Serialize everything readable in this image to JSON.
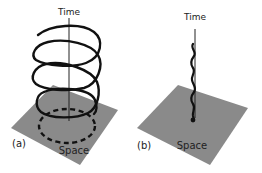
{
  "figure": {
    "panels": [
      {
        "id": "a",
        "label": "(a)",
        "axis_label": "Time",
        "plane_label": "Space",
        "curve": "helix",
        "description": "Helical worldline spiraling around the time axis above a spatial plane; bottom loop dashed below the plane"
      },
      {
        "id": "b",
        "label": "(b)",
        "axis_label": "Time",
        "plane_label": "Space",
        "curve": "wiggle",
        "description": "Tight wiggling worldline along the time axis, ending at a point on the spatial plane"
      }
    ],
    "colors": {
      "plane": "#8a8a8a",
      "line": "#111111",
      "axis": "#222222",
      "background": "#ffffff"
    }
  }
}
